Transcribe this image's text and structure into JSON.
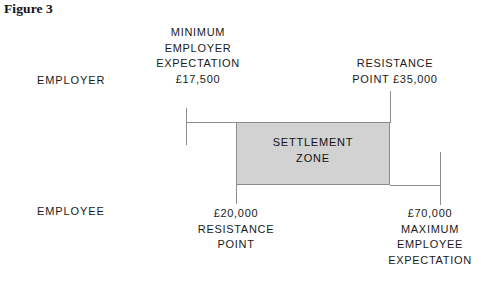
{
  "figure": {
    "title": "Figure 3"
  },
  "axis_labels": {
    "employer": "EMPLOYER",
    "employee": "EMPLOYEE"
  },
  "zone": {
    "line1": "SETTLEMENT",
    "line2": "ZONE",
    "fill_color": "#d2d2d2",
    "border_color": "#8a8a8a"
  },
  "callouts": {
    "minimum_employer_expectation": {
      "line1": "MINIMUM",
      "line2": "EMPLOYER",
      "line3": "EXPECTATION",
      "line4": "£17,500"
    },
    "employer_resistance_point": {
      "line1": "RESISTANCE",
      "line2": "POINT £35,000"
    },
    "employee_resistance_point": {
      "line1": "£20,000",
      "line2": "RESISTANCE",
      "line3": "POINT"
    },
    "maximum_employee_expectation": {
      "line1": "£70,000",
      "line2": "MAXIMUM",
      "line3": "EMPLOYEE",
      "line4": "EXPECTATION"
    }
  },
  "chart_data": {
    "type": "bar",
    "title": "Figure 3",
    "xlabel": "",
    "ylabel": "",
    "categories": [
      "Minimum employer expectation",
      "Employee resistance point",
      "Employer resistance point",
      "Maximum employee expectation"
    ],
    "values": [
      17500,
      20000,
      35000,
      70000
    ],
    "value_labels": [
      "£17,500",
      "£20,000",
      "£35,000",
      "£70,000"
    ],
    "series": [
      {
        "name": "Employer range",
        "from": 17500,
        "to": 35000,
        "from_label": "£17,500",
        "to_label": "£35,000"
      },
      {
        "name": "Employee range",
        "from": 20000,
        "to": 70000,
        "from_label": "£20,000",
        "to_label": "£70,000"
      },
      {
        "name": "Settlement zone",
        "from": 20000,
        "to": 35000,
        "from_label": "£20,000",
        "to_label": "£35,000"
      }
    ],
    "annotations": [
      "SETTLEMENT ZONE",
      "EMPLOYER",
      "EMPLOYEE"
    ],
    "grid": false,
    "legend": "none"
  }
}
